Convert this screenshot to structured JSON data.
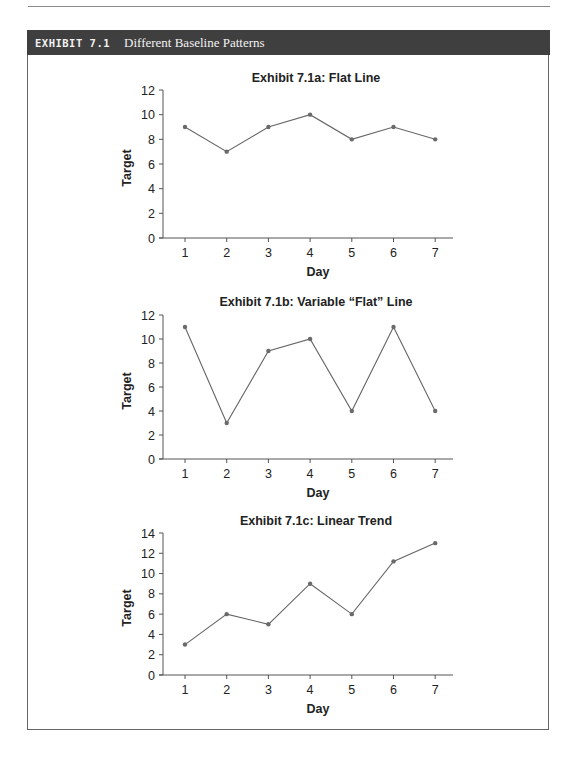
{
  "page": {
    "top_running_text": "",
    "exhibit": {
      "label": "EXHIBIT 7.1",
      "title": "Different Baseline Patterns"
    }
  },
  "chart_data": [
    {
      "type": "line",
      "title": "Exhibit 7.1a:  Flat Line",
      "xlabel": "Day",
      "ylabel": "Target",
      "x": [
        1,
        2,
        3,
        4,
        5,
        6,
        7
      ],
      "values": [
        9,
        7,
        9,
        10,
        8,
        9,
        8
      ],
      "yticks": [
        0,
        2,
        4,
        6,
        8,
        10,
        12
      ],
      "ylim": [
        0,
        12
      ],
      "grid": false,
      "legend": null
    },
    {
      "type": "line",
      "title": "Exhibit 7.1b:  Variable “Flat” Line",
      "xlabel": "Day",
      "ylabel": "Target",
      "x": [
        1,
        2,
        3,
        4,
        5,
        6,
        7
      ],
      "values": [
        11,
        3,
        9,
        10,
        4,
        11,
        4
      ],
      "yticks": [
        0,
        2,
        4,
        6,
        8,
        10,
        12
      ],
      "ylim": [
        0,
        12
      ],
      "grid": false,
      "legend": null
    },
    {
      "type": "line",
      "title": "Exhibit 7.1c:  Linear Trend",
      "xlabel": "Day",
      "ylabel": "Target",
      "x": [
        1,
        2,
        3,
        4,
        5,
        6,
        7
      ],
      "values": [
        3,
        6,
        5,
        9,
        6,
        11.2,
        13
      ],
      "yticks": [
        0,
        2,
        4,
        6,
        8,
        10,
        12,
        14
      ],
      "ylim": [
        0,
        14
      ],
      "grid": false,
      "legend": null
    }
  ],
  "layout": {
    "charts": [
      {
        "x0": 163,
        "x1": 453,
        "ytop": 90,
        "ybot": 238,
        "title_y": 82,
        "day1_x": 185,
        "dx": 41.7
      },
      {
        "x0": 163,
        "x1": 453,
        "ytop": 315,
        "ybot": 459,
        "title_y": 306,
        "day1_x": 185,
        "dx": 41.7
      },
      {
        "x0": 163,
        "x1": 453,
        "ytop": 533,
        "ybot": 675,
        "title_y": 525,
        "day1_x": 185,
        "dx": 41.7
      }
    ]
  }
}
